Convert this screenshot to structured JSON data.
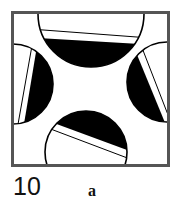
{
  "figure": {
    "frame_color": "#555555",
    "fill_color": "#000000",
    "segments": [
      "top",
      "left",
      "right",
      "bottom"
    ]
  },
  "caption": {
    "number": "10",
    "letter": "a"
  }
}
